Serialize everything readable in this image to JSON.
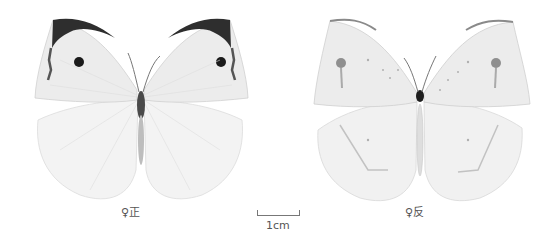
{
  "figure": {
    "specimens": [
      {
        "id": "left",
        "view": "dorsal",
        "label": "♀正",
        "colors": {
          "wing": "#eeeeee",
          "apex": "#2a2a2a",
          "spot": "#1a1a1a",
          "hindwing": "#f4f4f4"
        }
      },
      {
        "id": "right",
        "view": "ventral",
        "label": "♀反",
        "colors": {
          "wing": "#eeeeee",
          "apex": "#9a9a9a",
          "spot": "#8a8a8a",
          "hindwing": "#f0f0f0"
        }
      }
    ],
    "scale_bar": {
      "label": "1cm"
    }
  }
}
